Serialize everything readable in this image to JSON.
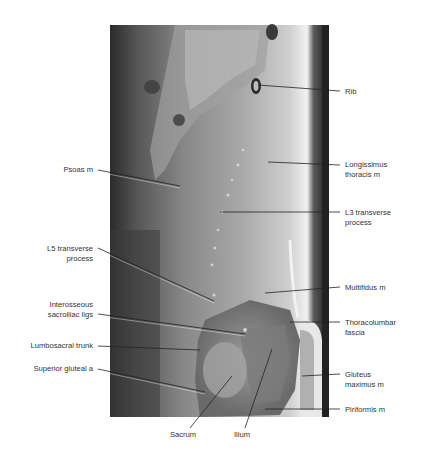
{
  "figure": {
    "type": "sagittal MRI, lumbosacral region",
    "labels_right": [
      {
        "text": "Rib",
        "x": 345,
        "y": 87
      },
      {
        "text": "Longissimus\nthoracis m",
        "x": 345,
        "y": 160
      },
      {
        "text": "L3 transverse\nprocess",
        "x": 345,
        "y": 208
      },
      {
        "text": "Multifidus m",
        "x": 345,
        "y": 283
      },
      {
        "text": "Thoracolumbar\nfascia",
        "x": 345,
        "y": 318
      },
      {
        "text": "Gluteus\nmaximus m",
        "x": 345,
        "y": 372
      },
      {
        "text": "Piriformis m",
        "x": 345,
        "y": 405
      }
    ],
    "labels_left": [
      {
        "text": "Psoas m",
        "x": 93,
        "y": 165
      },
      {
        "text": "L5 transverse\nprocess",
        "x": 93,
        "y": 244
      },
      {
        "text": "Interosseous\nsacroiliac ligs",
        "x": 93,
        "y": 300
      },
      {
        "text": "Lumbosacral trunk",
        "x": 93,
        "y": 341
      },
      {
        "text": "Superior gluteal a",
        "x": 93,
        "y": 364
      }
    ],
    "labels_bottom": [
      {
        "text": "Sacrum",
        "x": 185,
        "y": 430
      },
      {
        "text": "Ilium",
        "x": 245,
        "y": 430
      }
    ]
  }
}
